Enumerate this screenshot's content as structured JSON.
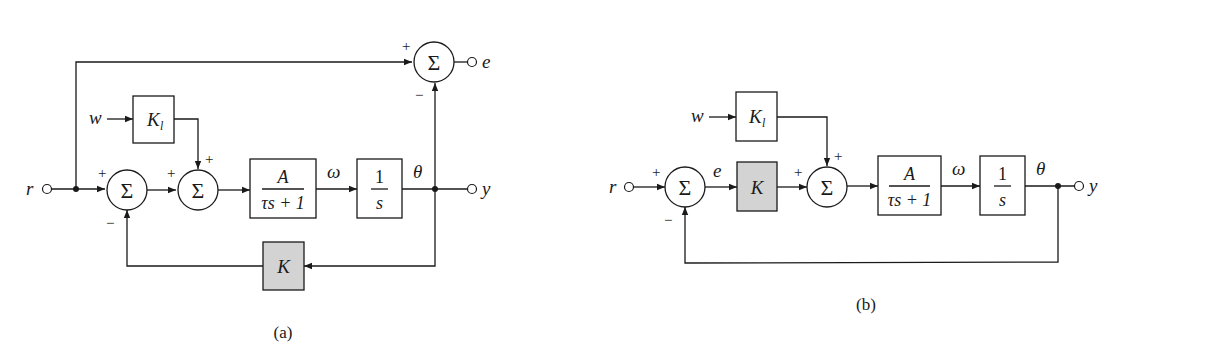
{
  "figure": {
    "panels": [
      {
        "id": "a",
        "caption": "(a)",
        "signals": {
          "input": "r",
          "disturbance": "w",
          "velocity": "ω",
          "angle": "θ",
          "output": "y",
          "error": "e"
        },
        "blocks": {
          "disturbance_gain": {
            "label": "K",
            "subscript": "l"
          },
          "plant": {
            "numerator": "A",
            "denominator": "τs + 1"
          },
          "integrator": {
            "numerator": "1",
            "denominator": "s"
          },
          "feedback_gain": {
            "label": "K",
            "fill": "#d3d3d3"
          }
        },
        "summers": {
          "sum1": {
            "symbol": "Σ",
            "signs": [
              "+",
              "−"
            ]
          },
          "sum2": {
            "symbol": "Σ",
            "signs": [
              "+",
              "+"
            ]
          },
          "error_sum": {
            "symbol": "Σ",
            "signs": [
              "+",
              "−"
            ]
          }
        }
      },
      {
        "id": "b",
        "caption": "(b)",
        "signals": {
          "input": "r",
          "disturbance": "w",
          "error": "e",
          "velocity": "ω",
          "angle": "θ",
          "output": "y"
        },
        "blocks": {
          "disturbance_gain": {
            "label": "K",
            "subscript": "l"
          },
          "controller": {
            "label": "K",
            "fill": "#d3d3d3"
          },
          "plant": {
            "numerator": "A",
            "denominator": "τs + 1"
          },
          "integrator": {
            "numerator": "1",
            "denominator": "s"
          }
        },
        "summers": {
          "sum1": {
            "symbol": "Σ",
            "signs": [
              "+",
              "−"
            ]
          },
          "sum2": {
            "symbol": "Σ",
            "signs": [
              "+",
              "+"
            ]
          }
        }
      }
    ]
  }
}
